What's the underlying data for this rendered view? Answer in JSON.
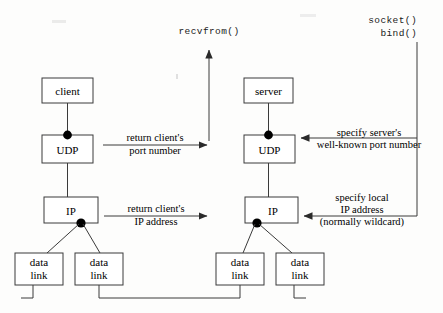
{
  "diagram": {
    "colors": {
      "line": "#3a3a3a",
      "text": "#000000",
      "background": "#fdfdfc"
    },
    "client_stack": {
      "app": "client",
      "transport": "UDP",
      "network": "IP",
      "datalink_1_line1": "data",
      "datalink_1_line2": "link",
      "datalink_2_line1": "data",
      "datalink_2_line2": "link"
    },
    "server_stack": {
      "app": "server",
      "transport": "UDP",
      "network": "IP",
      "datalink_1_line1": "data",
      "datalink_1_line2": "link",
      "datalink_2_line1": "data",
      "datalink_2_line2": "link"
    },
    "calls": {
      "client_call": "recvfrom()",
      "server_call_1": "socket()",
      "server_call_2": "bind()"
    },
    "annotations": {
      "client_port_line1": "return client's",
      "client_port_line2": "port number",
      "client_ip_line1": "return client's",
      "client_ip_line2": "IP address",
      "server_port_line1": "specify server's",
      "server_port_line2": "well-known port number",
      "server_ip_line1": "specify local",
      "server_ip_line2": "IP address",
      "server_ip_line3": "(normally wildcard)"
    }
  }
}
